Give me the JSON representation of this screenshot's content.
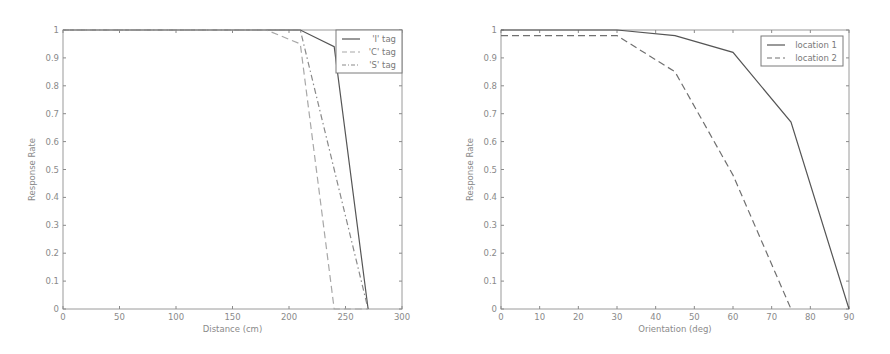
{
  "chart_data": [
    {
      "type": "line",
      "title": "",
      "xlabel": "Distance (cm)",
      "ylabel": "Response Rate",
      "xlim": [
        0,
        300
      ],
      "ylim": [
        0,
        1
      ],
      "xticks": [
        0,
        50,
        100,
        150,
        200,
        250,
        300
      ],
      "yticks": [
        0,
        0.1,
        0.2,
        0.3,
        0.4,
        0.5,
        0.6,
        0.7,
        0.8,
        0.9,
        1
      ],
      "grid": false,
      "legend_position": "upper right",
      "series": [
        {
          "name": "'I' tag",
          "style": "solid",
          "color": "#555555",
          "x": [
            0,
            30,
            60,
            90,
            120,
            150,
            180,
            210,
            240,
            270
          ],
          "y": [
            1,
            1,
            1,
            1,
            1,
            1,
            1,
            1,
            0.94,
            0
          ]
        },
        {
          "name": "'C' tag",
          "style": "dashed",
          "color": "#a8a8a8",
          "x": [
            0,
            30,
            60,
            90,
            120,
            150,
            180,
            210,
            240,
            270
          ],
          "y": [
            1,
            1,
            1,
            1,
            1,
            1,
            1,
            0.95,
            0,
            0
          ]
        },
        {
          "name": "'S' tag",
          "style": "dashdot",
          "color": "#8a8a8a",
          "x": [
            0,
            30,
            60,
            90,
            120,
            150,
            180,
            210,
            240,
            270
          ],
          "y": [
            1,
            1,
            1,
            1,
            1,
            1,
            1,
            1,
            0.5,
            0
          ]
        }
      ]
    },
    {
      "type": "line",
      "title": "",
      "xlabel": "Orientation (deg)",
      "ylabel": "Response Rate",
      "xlim": [
        0,
        90
      ],
      "ylim": [
        0,
        1
      ],
      "xticks": [
        0,
        10,
        20,
        30,
        40,
        50,
        60,
        70,
        80,
        90
      ],
      "yticks": [
        0,
        0.1,
        0.2,
        0.3,
        0.4,
        0.5,
        0.6,
        0.7,
        0.8,
        0.9,
        1
      ],
      "grid": false,
      "legend_position": "upper right",
      "series": [
        {
          "name": "location 1",
          "style": "solid",
          "color": "#555555",
          "x": [
            0,
            15,
            30,
            45,
            60,
            75,
            90
          ],
          "y": [
            1,
            1,
            1,
            0.98,
            0.92,
            0.67,
            0
          ]
        },
        {
          "name": "location 2",
          "style": "dashed",
          "color": "#707070",
          "x": [
            0,
            15,
            30,
            45,
            60,
            75
          ],
          "y": [
            0.98,
            0.98,
            0.98,
            0.85,
            0.48,
            0
          ]
        }
      ]
    }
  ]
}
